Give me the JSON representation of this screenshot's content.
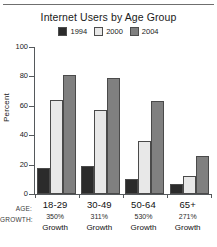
{
  "chart_data": {
    "type": "bar",
    "title": "Internet Users by Age Group",
    "xlabel": "",
    "ylabel": "Percent",
    "ylim": [
      0,
      100
    ],
    "yticks": [
      0,
      20,
      40,
      60,
      80,
      100
    ],
    "grid": false,
    "legend_position": "top-center",
    "categories": [
      "18-29",
      "30-49",
      "50-64",
      "65+"
    ],
    "series": [
      {
        "name": "1994",
        "color": "#2b2b2b",
        "values": [
          18,
          19,
          10,
          7
        ]
      },
      {
        "name": "2000",
        "color": "#e8e8e8",
        "values": [
          64,
          57,
          36,
          12
        ]
      },
      {
        "name": "2004",
        "color": "#808080",
        "values": [
          81,
          79,
          63,
          26
        ]
      }
    ],
    "annotations": {
      "age_row_label": "AGE:",
      "growth_row_label": "GROWTH:",
      "growth_word": "Growth",
      "growth_values": [
        "350%",
        "311%",
        "530%",
        "271%"
      ]
    }
  }
}
